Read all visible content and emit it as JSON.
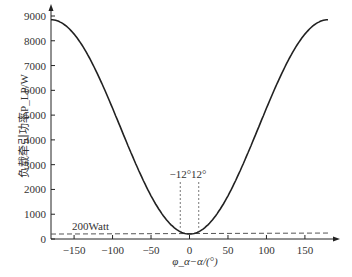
{
  "chart_data": {
    "type": "line",
    "title": "",
    "xlabel": "φ_α−α/(°)",
    "ylabel": "负载牵引功率P_LP/W",
    "xlim": [
      -180,
      180
    ],
    "ylim": [
      0,
      9000
    ],
    "x_ticks": [
      -150,
      -100,
      -50,
      0,
      50,
      100,
      150
    ],
    "y_ticks": [
      0,
      1000,
      2000,
      3000,
      4000,
      5000,
      6000,
      7000,
      8000,
      9000
    ],
    "grid": false,
    "series": [
      {
        "name": "P_LP",
        "x": [
          -180,
          -150,
          -120,
          -90,
          -60,
          -30,
          -12,
          0,
          12,
          30,
          60,
          90,
          120,
          150,
          180
        ],
        "values": [
          8850,
          8350,
          7000,
          5000,
          3000,
          1200,
          450,
          200,
          450,
          1200,
          3000,
          5000,
          7000,
          8350,
          8850
        ]
      }
    ],
    "reference_line": {
      "y": 200,
      "label": "200Watt",
      "style": "dashed"
    },
    "annotations": [
      {
        "x": -12,
        "label": "−12°",
        "style": "dotted vertical"
      },
      {
        "x": 12,
        "label": "12°",
        "style": "dotted vertical"
      }
    ]
  }
}
